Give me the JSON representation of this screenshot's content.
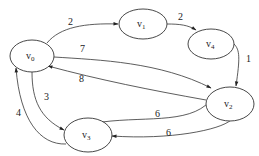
{
  "diagram": {
    "type": "directed-weighted-graph",
    "nodes": [
      {
        "id": "v0",
        "label": "v",
        "sub": "0"
      },
      {
        "id": "v1",
        "label": "v",
        "sub": "1"
      },
      {
        "id": "v4",
        "label": "v",
        "sub": "4"
      },
      {
        "id": "v2",
        "label": "v",
        "sub": "2"
      },
      {
        "id": "v3",
        "label": "v",
        "sub": "3"
      }
    ],
    "edges": [
      {
        "from": "v0",
        "to": "v1",
        "weight": "2"
      },
      {
        "from": "v1",
        "to": "v4",
        "weight": "2"
      },
      {
        "from": "v4",
        "to": "v2",
        "weight": "1"
      },
      {
        "from": "v0",
        "to": "v2",
        "weight": "7"
      },
      {
        "from": "v2",
        "to": "v0",
        "weight": "8"
      },
      {
        "from": "v0",
        "to": "v3",
        "weight": "3"
      },
      {
        "from": "v3",
        "to": "v0",
        "weight": "4"
      },
      {
        "from": "v3",
        "to": "v2",
        "weight": "6"
      },
      {
        "from": "v2",
        "to": "v3",
        "weight": "6"
      }
    ]
  }
}
